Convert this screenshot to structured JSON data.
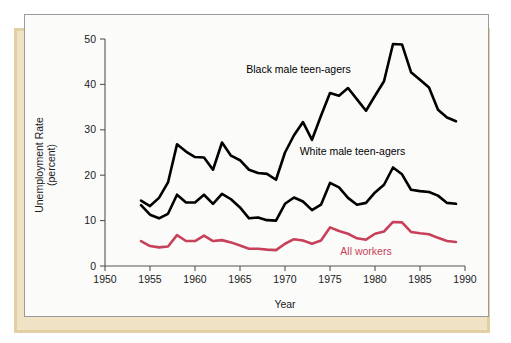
{
  "figure": {
    "axis_title_y_line1": "Unemployment Rate",
    "axis_title_y_line2": "(percent)",
    "axis_title_x": "Year",
    "y_ticks": [
      "0",
      "10",
      "20",
      "30",
      "40",
      "50"
    ],
    "x_ticks": [
      "1950",
      "1955",
      "1960",
      "1965",
      "1970",
      "1975",
      "1980",
      "1985",
      "1990"
    ],
    "label_black": "Black male teen-agers",
    "label_white": "White male teen-agers",
    "label_all": "All workers",
    "color_black": "#000000",
    "color_white": "#000000",
    "color_all": "#c8415a",
    "color_card": "#fbfbfa",
    "color_card_border": "#9a9a9a",
    "color_shadow": "#e3cfa4",
    "color_axis": "#555555"
  },
  "chart_data": {
    "type": "line",
    "title": "",
    "subtitle": "",
    "xlabel": "Year",
    "ylabel": "Unemployment Rate (percent)",
    "xlim": [
      1950,
      1990
    ],
    "ylim": [
      0,
      50
    ],
    "xticks": [
      1950,
      1955,
      1960,
      1965,
      1970,
      1975,
      1980,
      1985,
      1990
    ],
    "yticks": [
      0,
      10,
      20,
      30,
      40,
      50
    ],
    "grid": false,
    "legend": "inline-annotations",
    "x": [
      1954,
      1955,
      1956,
      1957,
      1958,
      1959,
      1960,
      1961,
      1962,
      1963,
      1964,
      1965,
      1966,
      1967,
      1968,
      1969,
      1970,
      1971,
      1972,
      1973,
      1974,
      1975,
      1976,
      1977,
      1978,
      1979,
      1980,
      1981,
      1982,
      1983,
      1984,
      1985,
      1986,
      1987,
      1988,
      1989
    ],
    "series": [
      {
        "name": "Black male teen-agers",
        "color": "#000000",
        "values": [
          14.4,
          13.2,
          15.0,
          18.4,
          26.8,
          25.2,
          24.0,
          23.9,
          21.2,
          27.2,
          24.3,
          23.3,
          21.2,
          20.5,
          20.3,
          19.0,
          25.0,
          28.8,
          31.7,
          27.8,
          33.1,
          38.1,
          37.5,
          39.2,
          36.7,
          34.2,
          37.5,
          40.7,
          48.9,
          48.8,
          42.7,
          41.0,
          39.3,
          34.4,
          32.7,
          31.9
        ]
      },
      {
        "name": "White male teen-agers",
        "color": "#000000",
        "values": [
          13.4,
          11.3,
          10.5,
          11.5,
          15.7,
          14.0,
          14.0,
          15.7,
          13.7,
          15.9,
          14.7,
          12.9,
          10.5,
          10.7,
          10.1,
          10.0,
          13.7,
          15.1,
          14.2,
          12.3,
          13.5,
          18.3,
          17.3,
          15.0,
          13.5,
          13.9,
          16.2,
          17.9,
          21.7,
          20.2,
          16.8,
          16.5,
          16.3,
          15.5,
          13.9,
          13.7
        ]
      },
      {
        "name": "All workers",
        "color": "#c8415a",
        "values": [
          5.5,
          4.4,
          4.1,
          4.3,
          6.8,
          5.5,
          5.5,
          6.7,
          5.5,
          5.7,
          5.2,
          4.5,
          3.8,
          3.8,
          3.6,
          3.5,
          4.9,
          5.9,
          5.6,
          4.9,
          5.6,
          8.5,
          7.7,
          7.1,
          6.1,
          5.8,
          7.1,
          7.6,
          9.7,
          9.6,
          7.5,
          7.2,
          7.0,
          6.2,
          5.5,
          5.3
        ]
      }
    ],
    "annotations": [
      {
        "text": "Black male teen-agers",
        "x": 1971.5,
        "y": 42.5,
        "color": "#000000"
      },
      {
        "text": "White male teen-agers",
        "x": 1977.5,
        "y": 24.5,
        "color": "#000000"
      },
      {
        "text": "All workers",
        "x": 1979.0,
        "y": 2.4,
        "color": "#c8415a"
      }
    ]
  }
}
